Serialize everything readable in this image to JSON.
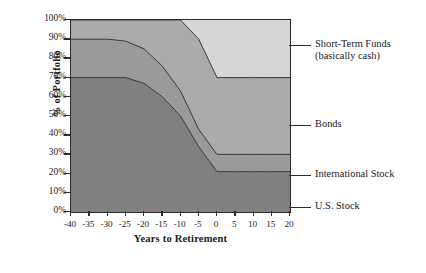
{
  "chart_data": {
    "type": "area",
    "stacked": true,
    "title": "",
    "xlabel": "Years to Retirement",
    "ylabel": "% of Portfolio",
    "xlim": [
      -40,
      20
    ],
    "ylim": [
      0,
      100
    ],
    "grid": false,
    "legend_position": "right-outside",
    "x": [
      -40,
      -35,
      -30,
      -25,
      -20,
      -15,
      -10,
      -5,
      0,
      5,
      10,
      15,
      20
    ],
    "xtick_labels": [
      "-40",
      "-35",
      "-30",
      "-25",
      "-20",
      "-15",
      "-10",
      "-5",
      "0",
      "5",
      "10",
      "15",
      "20"
    ],
    "ytick_labels": [
      "0%",
      "10%",
      "20%",
      "30%",
      "40%",
      "50%",
      "60%",
      "70%",
      "80%",
      "90%",
      "100%"
    ],
    "ytick_values": [
      0,
      10,
      20,
      30,
      40,
      50,
      60,
      70,
      80,
      90,
      100
    ],
    "series": [
      {
        "name": "U.S. Stock",
        "color": "#808080",
        "values": [
          70,
          70,
          70,
          70,
          67,
          60,
          50,
          34,
          21,
          21,
          21,
          21,
          21
        ]
      },
      {
        "name": "International Stock",
        "color": "#9a9a9a",
        "values": [
          20,
          20,
          20,
          19,
          18,
          16,
          13,
          9,
          9,
          9,
          9,
          9,
          9
        ]
      },
      {
        "name": "Bonds",
        "color": "#ababab",
        "values": [
          10,
          10,
          10,
          11,
          15,
          24,
          37,
          47,
          40,
          40,
          40,
          40,
          40
        ]
      },
      {
        "name": "Short-Term Funds (basically cash)",
        "color": "#d6d6d6",
        "values": [
          0,
          0,
          0,
          0,
          0,
          0,
          0,
          10,
          30,
          30,
          30,
          30,
          30
        ]
      }
    ],
    "cumulative_boundaries": {
      "us_stock_top": [
        70,
        70,
        70,
        70,
        67,
        60,
        50,
        34,
        21,
        21,
        21,
        21,
        21
      ],
      "international_stock_top": [
        90,
        90,
        90,
        89,
        85,
        76,
        63,
        43,
        30,
        30,
        30,
        30,
        30
      ],
      "bonds_top": [
        100,
        100,
        100,
        100,
        100,
        100,
        100,
        90,
        70,
        70,
        70,
        70,
        70
      ],
      "short_term_top": [
        100,
        100,
        100,
        100,
        100,
        100,
        100,
        100,
        100,
        100,
        100,
        100,
        100
      ]
    }
  },
  "legend": [
    {
      "label_line1": "Short-Term Funds",
      "label_line2": "(basically cash)",
      "y": 45
    },
    {
      "label_line1": "Bonds",
      "label_line2": "",
      "y": 125
    },
    {
      "label_line1": "International Stock",
      "label_line2": "",
      "y": 175
    },
    {
      "label_line1": "U.S. Stock",
      "label_line2": "",
      "y": 207
    }
  ]
}
